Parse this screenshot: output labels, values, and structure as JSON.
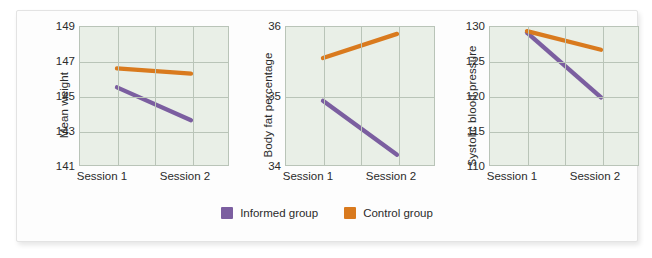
{
  "colors": {
    "informed": "#7b5ea0",
    "control": "#d97a1e",
    "plot_background": "#e9efe7",
    "gridline": "#b9c4b8",
    "text": "#2b2b2b",
    "card_background": "#fdfdfd"
  },
  "legend": {
    "position": "bottom-center",
    "items": [
      {
        "label": "Informed group",
        "color": "#7b5ea0",
        "swatch": "square-swatch"
      },
      {
        "label": "Control group",
        "color": "#d97a1e",
        "swatch": "square-swatch"
      }
    ]
  },
  "categories": [
    "Session 1",
    "Session 2"
  ],
  "chart_data": [
    {
      "type": "line",
      "title": "",
      "xlabel": "",
      "ylabel": "Mean weight",
      "categories": [
        "Session 1",
        "Session 2"
      ],
      "x": [
        1,
        2
      ],
      "ylim": [
        141,
        149
      ],
      "yticks": [
        141,
        143,
        145,
        147,
        149
      ],
      "grid": true,
      "series": [
        {
          "name": "Informed group",
          "color": "#7b5ea0",
          "values": [
            145.5,
            143.6
          ]
        },
        {
          "name": "Control group",
          "color": "#d97a1e",
          "values": [
            146.6,
            146.3
          ]
        }
      ]
    },
    {
      "type": "line",
      "title": "",
      "xlabel": "",
      "ylabel": "Body fat percentage",
      "categories": [
        "Session 1",
        "Session 2"
      ],
      "x": [
        1,
        2
      ],
      "ylim": [
        34,
        36
      ],
      "yticks": [
        34,
        35,
        36
      ],
      "grid": true,
      "series": [
        {
          "name": "Informed group",
          "color": "#7b5ea0",
          "values": [
            34.93,
            34.15
          ]
        },
        {
          "name": "Control group",
          "color": "#d97a1e",
          "values": [
            35.55,
            35.9
          ]
        }
      ]
    },
    {
      "type": "line",
      "title": "",
      "xlabel": "",
      "ylabel": "Systolic blood pressure",
      "categories": [
        "Session 1",
        "Session 2"
      ],
      "x": [
        1,
        2
      ],
      "ylim": [
        110,
        130
      ],
      "yticks": [
        110,
        115,
        120,
        125,
        130
      ],
      "grid": true,
      "series": [
        {
          "name": "Informed group",
          "color": "#7b5ea0",
          "values": [
            129.2,
            119.8
          ]
        },
        {
          "name": "Control group",
          "color": "#d97a1e",
          "values": [
            129.4,
            126.7
          ]
        }
      ]
    }
  ]
}
